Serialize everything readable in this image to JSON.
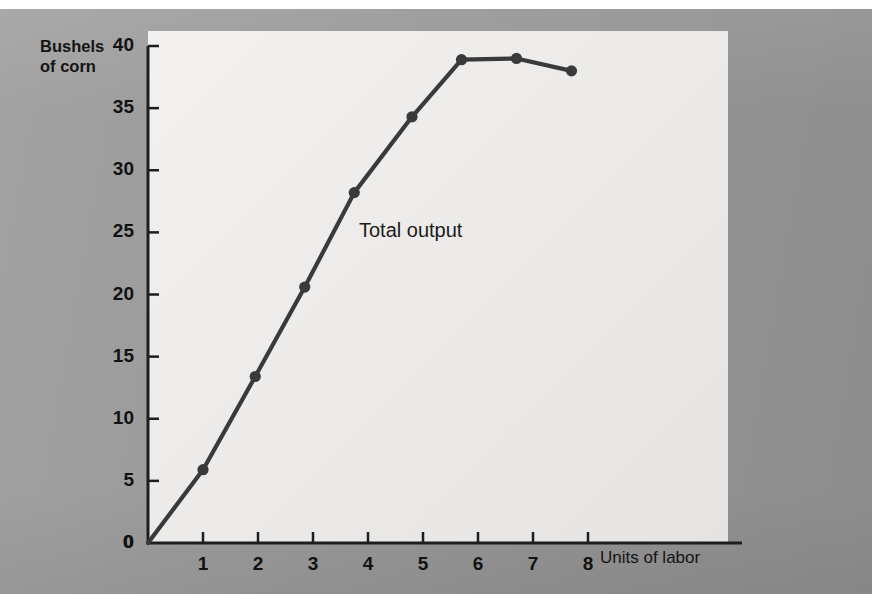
{
  "page": {
    "background_color": "#9d9d9d",
    "panel_color": "#ecebe9",
    "ink_color": "#3a3a3a"
  },
  "chart_data": {
    "type": "line",
    "title": "",
    "xlabel": "Units of labor",
    "ylabel": "Bushels of corn",
    "ylabel_line1": "Bushels",
    "ylabel_line2": "of corn",
    "annotation": "Total output",
    "grid": false,
    "legend": "none",
    "xlim": [
      0,
      8.6
    ],
    "ylim": [
      0,
      40
    ],
    "xticks": [
      0,
      1,
      2,
      3,
      4,
      5,
      6,
      7,
      8
    ],
    "xticklabels": [
      "0",
      "1",
      "2",
      "3",
      "4",
      "5",
      "6",
      "7",
      "8"
    ],
    "yticks": [
      0,
      5,
      10,
      15,
      20,
      25,
      30,
      35,
      40
    ],
    "yticklabels": [
      "0",
      "5",
      "10",
      "15",
      "20",
      "25",
      "30",
      "35",
      "40"
    ],
    "series": [
      {
        "name": "Total output",
        "marker": "circle",
        "color": "#3a3a3a",
        "x": [
          0,
          1.0,
          1.95,
          2.85,
          3.75,
          4.8,
          5.7,
          6.7,
          7.7
        ],
        "y": [
          0,
          5.9,
          13.4,
          20.6,
          28.2,
          34.3,
          38.9,
          39.0,
          38.0
        ]
      }
    ]
  }
}
